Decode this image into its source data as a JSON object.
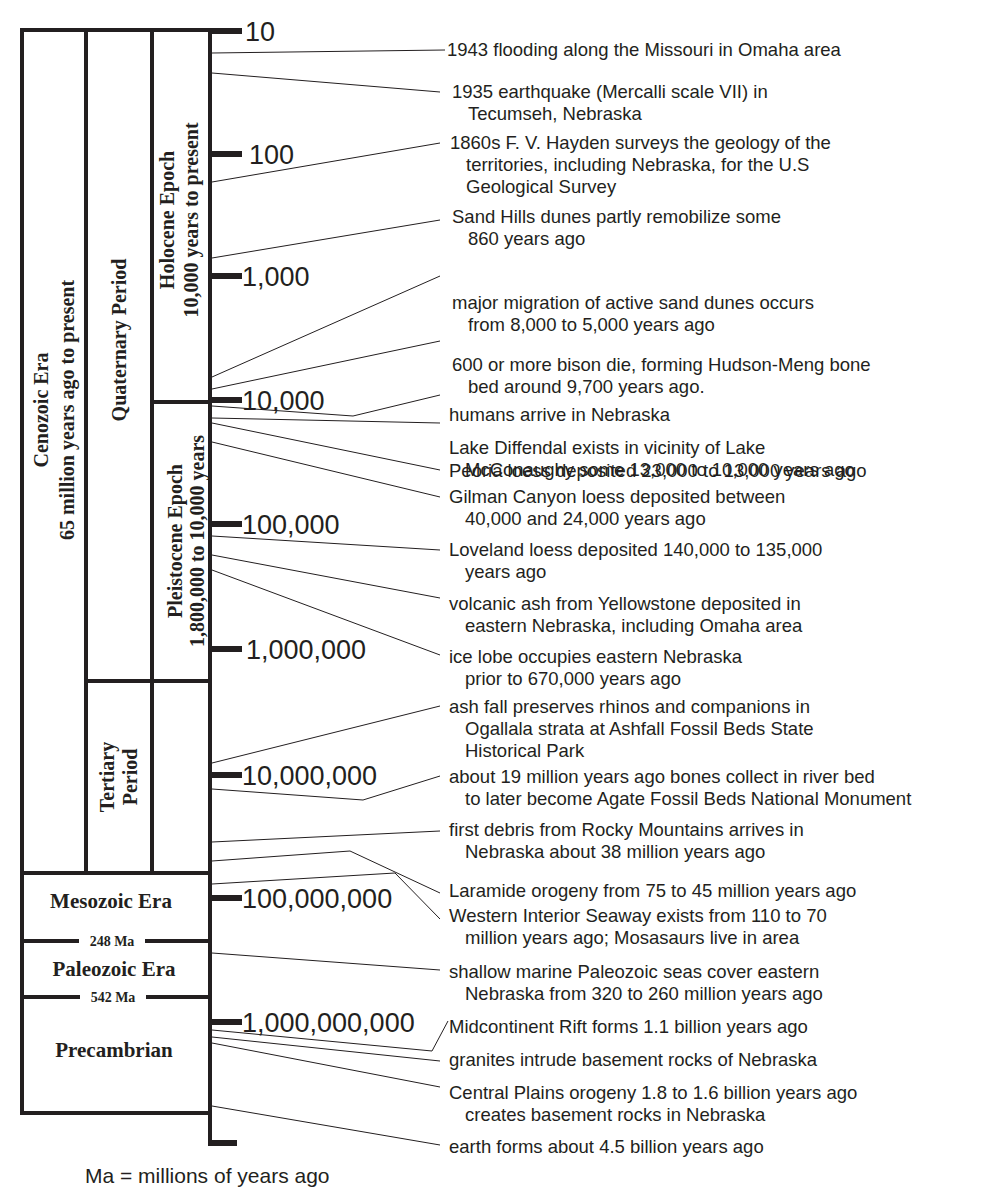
{
  "diagram": {
    "type": "geologic-time-scale",
    "scale": "logarithmic, years before present",
    "axis_ticks": [
      "10",
      "100",
      "1,000",
      "10,000",
      "100,000",
      "1,000,000",
      "10,000,000",
      "100,000,000",
      "1,000,000,000"
    ],
    "divisions": {
      "cenozoic": {
        "line1": "Cenozoic Era",
        "line2": "65 million years ago to present"
      },
      "quaternary": {
        "line1": "Quaternary Period"
      },
      "holocene": {
        "line1": "Holocene Epoch",
        "line2": "10,000 years to present"
      },
      "pleistocene": {
        "line1": "Pleistocene Epoch",
        "line2": "1,800,000 to 10,000 years"
      },
      "tertiary": {
        "line1": "Tertiary",
        "line2": "Period"
      },
      "mesozoic": {
        "line1": "Mesozoic Era"
      },
      "paleozoic": {
        "line1": "Paleozoic Era"
      },
      "precambrian": {
        "line1": "Precambrian"
      }
    },
    "boundaries": {
      "mesozoic_paleozoic": "248 Ma",
      "paleozoic_precambrian": "542 Ma"
    },
    "events": [
      {
        "lines": [
          "1943 flooding along the Missouri in Omaha area"
        ]
      },
      {
        "lines": [
          "1935 earthquake (Mercalli scale VII) in",
          "Tecumseh, Nebraska"
        ]
      },
      {
        "lines": [
          "1860s F. V. Hayden surveys the geology of the",
          "territories, including Nebraska, for the U.S",
          "Geological Survey"
        ]
      },
      {
        "lines": [
          "Sand Hills dunes partly remobilize some",
          "860 years ago"
        ]
      },
      {
        "lines": [
          "major migration of active sand dunes occurs",
          "from 8,000 to 5,000 years ago"
        ]
      },
      {
        "lines": [
          "600 or more bison die, forming Hudson-Meng bone",
          "bed around 9,700 years ago."
        ]
      },
      {
        "lines": [
          "humans arrive in Nebraska"
        ]
      },
      {
        "lines": [
          "Lake Diffendal exists in vicinity of Lake",
          "McConaughy some 13,000 to 10,000 years ago"
        ]
      },
      {
        "lines": [
          "Peoria loess deposited 23,000 to 13,000 years ago"
        ]
      },
      {
        "lines": [
          "Gilman Canyon loess deposited between",
          "40,000 and 24,000 years ago"
        ]
      },
      {
        "lines": [
          "Loveland loess deposited 140,000 to 135,000",
          "years ago"
        ]
      },
      {
        "lines": [
          "volcanic ash from Yellowstone deposited in",
          "eastern Nebraska, including Omaha area"
        ]
      },
      {
        "lines": [
          "ice lobe occupies eastern Nebraska",
          "prior to 670,000 years ago"
        ]
      },
      {
        "lines": [
          "ash fall preserves rhinos and companions in",
          "Ogallala strata at Ashfall Fossil Beds State",
          "Historical Park"
        ]
      },
      {
        "lines": [
          "about 19 million years ago bones collect in river bed",
          "to later become Agate Fossil Beds National Monument"
        ]
      },
      {
        "lines": [
          "first debris from Rocky Mountains arrives in",
          "Nebraska about 38 million years ago"
        ]
      },
      {
        "lines": [
          "Laramide orogeny from 75 to 45 million years ago"
        ]
      },
      {
        "lines": [
          "Western Interior Seaway exists from 110 to 70",
          "million years ago; Mosasaurs live in area"
        ]
      },
      {
        "lines": [
          "shallow marine Paleozoic seas cover eastern",
          "Nebraska from 320 to 260 million years ago"
        ]
      },
      {
        "lines": [
          "Midcontinent Rift forms 1.1 billion years ago"
        ]
      },
      {
        "lines": [
          "granites intrude basement rocks of Nebraska"
        ]
      },
      {
        "lines": [
          "Central Plains orogeny 1.8 to 1.6 billion years ago",
          "creates basement rocks in Nebraska"
        ]
      },
      {
        "lines": [
          "earth forms about 4.5 billion years ago"
        ]
      }
    ],
    "footnote": "Ma = millions of years ago"
  }
}
